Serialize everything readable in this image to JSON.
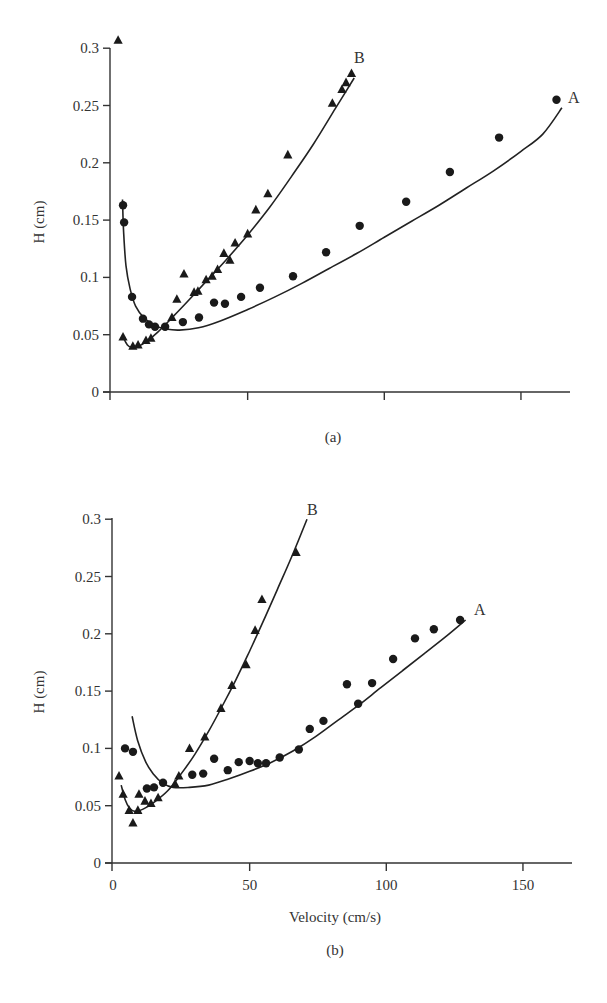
{
  "chart_data": [
    {
      "panel": "(a)",
      "type": "scatter",
      "title": "",
      "xlabel": "",
      "ylabel": "H (cm)",
      "xlim": [
        0,
        165
      ],
      "ylim": [
        0,
        0.3
      ],
      "x_ticks": [
        0,
        50,
        100,
        150
      ],
      "x_tick_labels": [
        "",
        "",
        "",
        ""
      ],
      "y_ticks": [
        0,
        0.05,
        0.1,
        0.15,
        0.2,
        0.25,
        0.3
      ],
      "y_tick_labels": [
        "0",
        "0.05",
        "0.1",
        "0.15",
        "0.2",
        "0.25",
        "0.3"
      ],
      "grid": false,
      "legend": "inline labels at curve ends",
      "series": [
        {
          "name": "A",
          "marker": "circle",
          "points": [
            [
              4.4,
              0.163
            ],
            [
              4.8,
              0.148
            ],
            [
              7.7,
              0.083
            ],
            [
              11.7,
              0.064
            ],
            [
              13.9,
              0.059
            ],
            [
              16.1,
              0.057
            ],
            [
              19.8,
              0.057
            ],
            [
              26.3,
              0.061
            ],
            [
              32.2,
              0.065
            ],
            [
              37.7,
              0.078
            ],
            [
              41.7,
              0.077
            ],
            [
              47.6,
              0.083
            ],
            [
              54.5,
              0.091
            ],
            [
              66.6,
              0.101
            ],
            [
              78.7,
              0.122
            ],
            [
              91,
              0.145
            ],
            [
              108,
              0.166
            ],
            [
              124,
              0.192
            ],
            [
              142,
              0.222
            ],
            [
              163,
              0.255
            ]
          ],
          "fit": [
            [
              4.2,
              0.168
            ],
            [
              4.6,
              0.14
            ],
            [
              5.5,
              0.11
            ],
            [
              7,
              0.09
            ],
            [
              9,
              0.075
            ],
            [
              12,
              0.065
            ],
            [
              16,
              0.058
            ],
            [
              20,
              0.055
            ],
            [
              25,
              0.054
            ],
            [
              32,
              0.056
            ],
            [
              40,
              0.062
            ],
            [
              50,
              0.072
            ],
            [
              60,
              0.083
            ],
            [
              70,
              0.095
            ],
            [
              80,
              0.108
            ],
            [
              90,
              0.121
            ],
            [
              100,
              0.135
            ],
            [
              110,
              0.149
            ],
            [
              120,
              0.163
            ],
            [
              130,
              0.178
            ],
            [
              140,
              0.193
            ],
            [
              150,
              0.21
            ],
            [
              158,
              0.225
            ],
            [
              165,
              0.248
            ]
          ]
        },
        {
          "name": "B",
          "marker": "triangle",
          "points": [
            [
              2.6,
              0.307
            ],
            [
              4.4,
              0.048
            ],
            [
              8,
              0.04
            ],
            [
              9.9,
              0.041
            ],
            [
              12.8,
              0.045
            ],
            [
              14.6,
              0.047
            ],
            [
              22.3,
              0.065
            ],
            [
              24.1,
              0.081
            ],
            [
              26.7,
              0.103
            ],
            [
              30.4,
              0.087
            ],
            [
              31.8,
              0.088
            ],
            [
              34.8,
              0.098
            ],
            [
              37,
              0.101
            ],
            [
              39,
              0.107
            ],
            [
              41.3,
              0.121
            ],
            [
              43.5,
              0.115
            ],
            [
              45.4,
              0.13
            ],
            [
              50,
              0.138
            ],
            [
              53,
              0.159
            ],
            [
              57.4,
              0.173
            ],
            [
              64.7,
              0.207
            ],
            [
              81,
              0.252
            ],
            [
              84.5,
              0.264
            ],
            [
              86,
              0.27
            ],
            [
              88,
              0.278
            ]
          ],
          "fit": [
            [
              4.6,
              0.047
            ],
            [
              6,
              0.041
            ],
            [
              7.5,
              0.039
            ],
            [
              10,
              0.04
            ],
            [
              13,
              0.044
            ],
            [
              17,
              0.052
            ],
            [
              22,
              0.064
            ],
            [
              28,
              0.079
            ],
            [
              35,
              0.097
            ],
            [
              42,
              0.115
            ],
            [
              50,
              0.137
            ],
            [
              58,
              0.161
            ],
            [
              66,
              0.188
            ],
            [
              74,
              0.216
            ],
            [
              82,
              0.247
            ],
            [
              89,
              0.274
            ]
          ]
        }
      ],
      "annotations": [
        "A",
        "B",
        "(a)"
      ]
    },
    {
      "panel": "(b)",
      "type": "scatter",
      "title": "",
      "xlabel": "Velocity (cm/s)",
      "ylabel": "H (cm)",
      "xlim": [
        0,
        165
      ],
      "ylim": [
        0,
        0.3
      ],
      "x_ticks": [
        0,
        50,
        100,
        150
      ],
      "x_tick_labels": [
        "0",
        "50",
        "100",
        "150"
      ],
      "y_ticks": [
        0,
        0.05,
        0.1,
        0.15,
        0.2,
        0.25,
        0.3
      ],
      "y_tick_labels": [
        "0",
        "0.05",
        "0.1",
        "0.15",
        "0.2",
        "0.25",
        "0.3"
      ],
      "grid": false,
      "legend": "inline labels at curve ends",
      "series": [
        {
          "name": "A",
          "marker": "circle",
          "points": [
            [
              4.4,
              0.1
            ],
            [
              7.3,
              0.097
            ],
            [
              12.4,
              0.065
            ],
            [
              15,
              0.066
            ],
            [
              18.3,
              0.07
            ],
            [
              29,
              0.077
            ],
            [
              33,
              0.078
            ],
            [
              37,
              0.091
            ],
            [
              42,
              0.081
            ],
            [
              46,
              0.088
            ],
            [
              50,
              0.089
            ],
            [
              53,
              0.087
            ],
            [
              56,
              0.087
            ],
            [
              61,
              0.092
            ],
            [
              68,
              0.099
            ],
            [
              72,
              0.117
            ],
            [
              77,
              0.124
            ],
            [
              85.6,
              0.156
            ],
            [
              89.7,
              0.139
            ],
            [
              94.8,
              0.157
            ],
            [
              102.5,
              0.178
            ],
            [
              110.5,
              0.196
            ],
            [
              117.4,
              0.204
            ],
            [
              127,
              0.212
            ]
          ],
          "fit": [
            [
              7,
              0.128
            ],
            [
              9,
              0.107
            ],
            [
              12,
              0.088
            ],
            [
              15,
              0.077
            ],
            [
              18,
              0.07
            ],
            [
              22,
              0.066
            ],
            [
              28,
              0.066
            ],
            [
              35,
              0.068
            ],
            [
              42,
              0.073
            ],
            [
              50,
              0.08
            ],
            [
              58,
              0.088
            ],
            [
              66,
              0.098
            ],
            [
              74,
              0.11
            ],
            [
              82,
              0.124
            ],
            [
              90,
              0.138
            ],
            [
              98,
              0.153
            ],
            [
              106,
              0.168
            ],
            [
              114,
              0.183
            ],
            [
              122,
              0.198
            ],
            [
              129,
              0.212
            ]
          ]
        },
        {
          "name": "B",
          "marker": "triangle",
          "points": [
            [
              2.2,
              0.076
            ],
            [
              3.7,
              0.06
            ],
            [
              5.9,
              0.046
            ],
            [
              7.3,
              0.035
            ],
            [
              9.1,
              0.046
            ],
            [
              9.5,
              0.06
            ],
            [
              11.7,
              0.054
            ],
            [
              13.9,
              0.052
            ],
            [
              16.5,
              0.057
            ],
            [
              22.7,
              0.069
            ],
            [
              24.1,
              0.076
            ],
            [
              28,
              0.1
            ],
            [
              33.6,
              0.11
            ],
            [
              39.5,
              0.135
            ],
            [
              43.5,
              0.155
            ],
            [
              48.7,
              0.173
            ],
            [
              52,
              0.203
            ],
            [
              54.5,
              0.23
            ],
            [
              67,
              0.271
            ]
          ],
          "fit": [
            [
              3,
              0.068
            ],
            [
              4.5,
              0.055
            ],
            [
              6,
              0.048
            ],
            [
              8,
              0.045
            ],
            [
              11,
              0.047
            ],
            [
              15,
              0.053
            ],
            [
              20,
              0.063
            ],
            [
              25,
              0.078
            ],
            [
              30,
              0.095
            ],
            [
              35,
              0.115
            ],
            [
              40,
              0.137
            ],
            [
              45,
              0.16
            ],
            [
              50,
              0.185
            ],
            [
              55,
              0.211
            ],
            [
              60,
              0.238
            ],
            [
              65,
              0.265
            ],
            [
              71,
              0.3
            ]
          ]
        }
      ],
      "annotations": [
        "A",
        "B",
        "(b)"
      ]
    }
  ],
  "panel_a": {
    "ylabel": "H (cm)",
    "y_ticks": [
      "0",
      "0.05",
      "0.1",
      "0.15",
      "0.2",
      "0.25",
      "0.3"
    ],
    "label_A": "A",
    "label_B": "B",
    "panel_label": "(a)"
  },
  "panel_b": {
    "ylabel": "H (cm)",
    "xlabel": "Velocity (cm/s)",
    "y_ticks": [
      "0",
      "0.05",
      "0.1",
      "0.15",
      "0.2",
      "0.25",
      "0.3"
    ],
    "x_ticks": [
      "0",
      "50",
      "100",
      "150"
    ],
    "label_A": "A",
    "label_B": "B",
    "panel_label": "(b)"
  }
}
